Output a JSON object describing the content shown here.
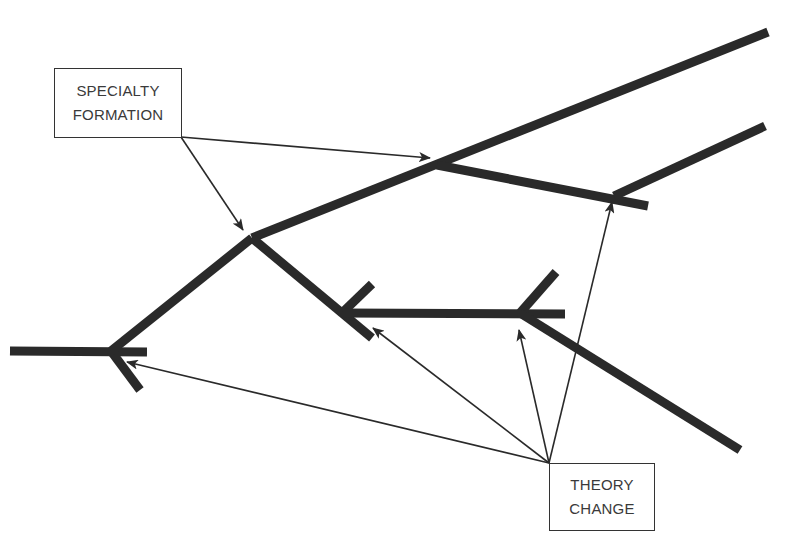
{
  "diagram": {
    "type": "branching tree with annotated nodes",
    "labels": {
      "specialty_formation": {
        "line1": "SPECIALTY",
        "line2": "FORMATION"
      },
      "theory_change": {
        "line1": "THEORY",
        "line2": "CHANGE"
      }
    },
    "colors": {
      "branch": "#2a2a2a",
      "pointer": "#2a2a2a",
      "label_text": "#3a3a3a",
      "background": "#ffffff"
    },
    "branches": [
      {
        "id": "trunk",
        "from": [
          10,
          351
        ],
        "to": [
          147,
          352
        ]
      },
      {
        "id": "trunk-lower-stub",
        "from": [
          111,
          351
        ],
        "to": [
          140,
          390
        ]
      },
      {
        "id": "trunk-to-node-b",
        "from": [
          111,
          351
        ],
        "to": [
          252,
          238
        ]
      },
      {
        "id": "upper-main",
        "from": [
          252,
          238
        ],
        "to": [
          768,
          32
        ]
      },
      {
        "id": "upper-side",
        "from": [
          437,
          165
        ],
        "to": [
          648,
          206
        ]
      },
      {
        "id": "upper-side-fork",
        "from": [
          614,
          196
        ],
        "to": [
          765,
          126
        ]
      },
      {
        "id": "middle-down",
        "from": [
          252,
          238
        ],
        "to": [
          372,
          338
        ]
      },
      {
        "id": "middle-up-stub",
        "from": [
          343,
          312
        ],
        "to": [
          372,
          284
        ]
      },
      {
        "id": "middle-horizontal",
        "from": [
          343,
          313
        ],
        "to": [
          565,
          314
        ]
      },
      {
        "id": "middle-right-up",
        "from": [
          520,
          313
        ],
        "to": [
          556,
          272
        ]
      },
      {
        "id": "middle-right-down",
        "from": [
          520,
          313
        ],
        "to": [
          740,
          450
        ]
      }
    ],
    "pointers": [
      {
        "source": "specialty_formation",
        "from": [
          181,
          137
        ],
        "to": [
          430,
          158
        ]
      },
      {
        "source": "specialty_formation",
        "from": [
          181,
          137
        ],
        "to": [
          243,
          230
        ]
      },
      {
        "source": "theory_change",
        "from": [
          549,
          463
        ],
        "to": [
          127,
          362
        ]
      },
      {
        "source": "theory_change",
        "from": [
          549,
          463
        ],
        "to": [
          373,
          328
        ]
      },
      {
        "source": "theory_change",
        "from": [
          549,
          463
        ],
        "to": [
          519,
          330
        ]
      },
      {
        "source": "theory_change",
        "from": [
          549,
          463
        ],
        "to": [
          612,
          202
        ]
      }
    ]
  }
}
